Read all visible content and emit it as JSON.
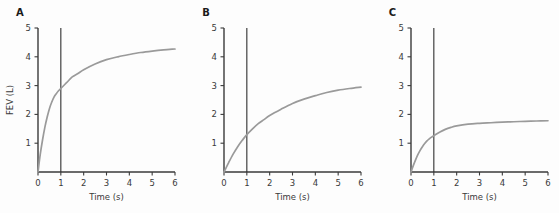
{
  "figure": {
    "background_color": "#fdfdfd",
    "curve_color": "#9a9a9a",
    "axis_color": "#3a3a3a",
    "vline_color": "#2e2e2e",
    "panel_count": 3
  },
  "chart_data": [
    {
      "type": "line",
      "panel_label": "A",
      "title": "",
      "xlabel": "Time (s)",
      "ylabel": "FEV (L)",
      "xlim": [
        0,
        6
      ],
      "ylim": [
        0,
        5
      ],
      "xticks": [
        0,
        1,
        2,
        3,
        4,
        5,
        6
      ],
      "xticklabels": [
        "0",
        "1",
        "2",
        "3",
        "4",
        "5",
        "6"
      ],
      "yticks": [
        1,
        2,
        3,
        4,
        5
      ],
      "yticklabels": [
        "1",
        "2",
        "3",
        "4",
        "5"
      ],
      "grid": false,
      "legend": false,
      "annotations": [
        {
          "type": "vline",
          "x": 1,
          "label": "FEV1 marker",
          "ymin": 0,
          "ymax": 5
        }
      ],
      "series": [
        {
          "name": "Normal spirogram",
          "color": "#9a9a9a",
          "x": [
            0,
            0.1,
            0.2,
            0.3,
            0.4,
            0.5,
            0.6,
            0.7,
            0.8,
            0.9,
            1.0,
            1.25,
            1.5,
            1.75,
            2.0,
            2.5,
            3.0,
            3.5,
            4.0,
            4.5,
            5.0,
            5.5,
            6.0
          ],
          "y": [
            0.0,
            0.62,
            1.12,
            1.55,
            1.9,
            2.2,
            2.42,
            2.6,
            2.72,
            2.82,
            2.9,
            3.1,
            3.3,
            3.42,
            3.55,
            3.75,
            3.9,
            4.0,
            4.08,
            4.15,
            4.2,
            4.24,
            4.27
          ]
        }
      ],
      "fev1": 2.9,
      "fvc": 4.27
    },
    {
      "type": "line",
      "panel_label": "B",
      "title": "",
      "xlabel": "Time (s)",
      "ylabel": "",
      "xlim": [
        0,
        6
      ],
      "ylim": [
        0,
        5
      ],
      "xticks": [
        0,
        1,
        2,
        3,
        4,
        5,
        6
      ],
      "xticklabels": [
        "0",
        "1",
        "2",
        "3",
        "4",
        "5",
        "6"
      ],
      "yticks": [
        1,
        2,
        3,
        4,
        5
      ],
      "yticklabels": [
        "1",
        "2",
        "3",
        "4",
        "5"
      ],
      "grid": false,
      "legend": false,
      "annotations": [
        {
          "type": "vline",
          "x": 1,
          "label": "FEV1 marker",
          "ymin": 0,
          "ymax": 5
        }
      ],
      "series": [
        {
          "name": "Obstructive spirogram",
          "color": "#9a9a9a",
          "x": [
            0,
            0.2,
            0.4,
            0.6,
            0.8,
            1.0,
            1.25,
            1.5,
            1.75,
            2.0,
            2.5,
            3.0,
            3.5,
            4.0,
            4.5,
            5.0,
            5.5,
            6.0
          ],
          "y": [
            0.0,
            0.32,
            0.62,
            0.88,
            1.1,
            1.3,
            1.5,
            1.68,
            1.82,
            1.96,
            2.18,
            2.38,
            2.53,
            2.65,
            2.76,
            2.84,
            2.9,
            2.95
          ]
        }
      ],
      "fev1": 1.3,
      "fvc": 2.95
    },
    {
      "type": "line",
      "panel_label": "C",
      "title": "",
      "xlabel": "Time (s)",
      "ylabel": "",
      "xlim": [
        0,
        6
      ],
      "ylim": [
        0,
        5
      ],
      "xticks": [
        0,
        1,
        2,
        3,
        4,
        5,
        6
      ],
      "xticklabels": [
        "0",
        "1",
        "2",
        "3",
        "4",
        "5",
        "6"
      ],
      "yticks": [
        1,
        2,
        3,
        4,
        5
      ],
      "yticklabels": [
        "1",
        "2",
        "3",
        "4",
        "5"
      ],
      "grid": false,
      "legend": false,
      "annotations": [
        {
          "type": "vline",
          "x": 1,
          "label": "FEV1 marker",
          "ymin": 0,
          "ymax": 5
        }
      ],
      "series": [
        {
          "name": "Restrictive spirogram",
          "color": "#9a9a9a",
          "x": [
            0,
            0.1,
            0.2,
            0.3,
            0.4,
            0.5,
            0.6,
            0.7,
            0.8,
            0.9,
            1.0,
            1.25,
            1.5,
            1.75,
            2.0,
            2.5,
            3.0,
            3.5,
            4.0,
            4.5,
            5.0,
            5.5,
            6.0
          ],
          "y": [
            0.0,
            0.22,
            0.42,
            0.6,
            0.75,
            0.88,
            0.99,
            1.08,
            1.15,
            1.21,
            1.26,
            1.38,
            1.48,
            1.55,
            1.6,
            1.66,
            1.69,
            1.71,
            1.73,
            1.745,
            1.76,
            1.77,
            1.78
          ]
        }
      ],
      "fev1": 1.26,
      "fvc": 1.78
    }
  ]
}
